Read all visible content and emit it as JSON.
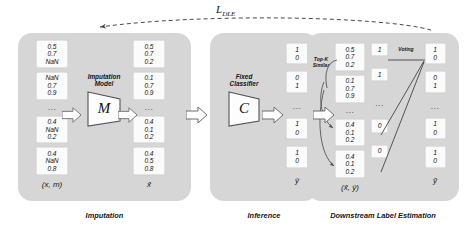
{
  "figure": {
    "loss_label": "L",
    "loss_subscript": "DLE"
  },
  "panels": [
    {
      "key": "imputation",
      "caption": "Imputation",
      "model_title_line1": "Imputation",
      "model_title_line2": "Model",
      "model_symbol": "M",
      "input_label": "(x, m)",
      "output_label": "x̂",
      "input_blocks": [
        [
          "0.5",
          "0.7",
          "NaN"
        ],
        [
          "NaN",
          "0.7",
          "0.9"
        ],
        [
          "⋯"
        ],
        [
          "0.4",
          "NaN",
          "0.2"
        ],
        [
          "0.4",
          "NaN",
          "0.8"
        ]
      ],
      "output_blocks": [
        [
          "0.5",
          "0.7",
          "0.2"
        ],
        [
          "0.1",
          "0.7",
          "0.9"
        ],
        [
          "⋯"
        ],
        [
          "0.4",
          "0.1",
          "0.2"
        ],
        [
          "0.4",
          "0.5",
          "0.8"
        ]
      ]
    },
    {
      "key": "inference",
      "caption": "Inference",
      "model_title_line1": "Fixed",
      "model_title_line2": "Classifier",
      "model_symbol": "C",
      "output_label": "ŷ",
      "output_blocks": [
        [
          "1",
          "0"
        ],
        [
          "0",
          "1"
        ],
        [
          "⋯"
        ],
        [
          "1",
          "0"
        ],
        [
          "1",
          "0"
        ]
      ]
    },
    {
      "key": "downstream",
      "caption": "Downstream Label Estimation",
      "topk_line1": "Top-K",
      "topk_line2": "Similar",
      "voting_label": "Voting",
      "pair_label": "(x̂, ŷ)",
      "final_label": "ỹ",
      "x_blocks": [
        [
          "0.5",
          "0.7",
          "0.2"
        ],
        [
          "0.1",
          "0.7",
          "0.9"
        ],
        [
          "⋯"
        ],
        [
          "0.4",
          "0.1",
          "0.2"
        ],
        [
          "0.4",
          "0.1",
          "0.2"
        ]
      ],
      "y_blocks": [
        [
          "1"
        ],
        [
          "1"
        ],
        [
          "⋯"
        ],
        [
          "0"
        ],
        [
          "0"
        ]
      ],
      "final_blocks": [
        [
          "1",
          "0"
        ],
        [
          "0",
          "1"
        ],
        [
          "⋯"
        ],
        [
          "1",
          "0"
        ],
        [
          "1",
          "0"
        ]
      ]
    }
  ],
  "colors": {
    "panel_bg": "#d6d6d6",
    "cell_bg": "#fbfbfb",
    "stroke": "#6e6e6e",
    "page_bg": "#ffffff"
  }
}
